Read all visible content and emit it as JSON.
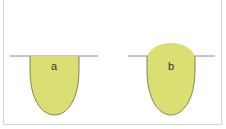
{
  "colors": {
    "fill": "#d9df72",
    "outline": "#6b6a3a",
    "surface_line": "#8a8a8a",
    "frame": "#d4d4d4"
  },
  "panels": [
    {
      "label": "a",
      "shape": "flat-meniscus"
    },
    {
      "label": "b",
      "shape": "convex-meniscus"
    }
  ]
}
